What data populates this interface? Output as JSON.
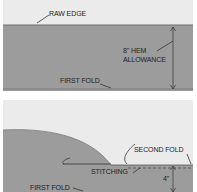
{
  "colors": {
    "background": "#ebebeb",
    "fabric": "#9c9c9c",
    "line": "#333333"
  },
  "top_panel": {
    "labels": {
      "raw_edge": "RAW EDGE",
      "hem_allowance_line1": "8\" HEM",
      "hem_allowance_line2": "ALLOWANCE",
      "first_fold": "FIRST FOLD"
    }
  },
  "bottom_panel": {
    "labels": {
      "second_fold": "SECOND FOLD",
      "stitching": "STITCHING",
      "four_inch": "4\"",
      "first_fold": "FIRST FOLD"
    }
  }
}
